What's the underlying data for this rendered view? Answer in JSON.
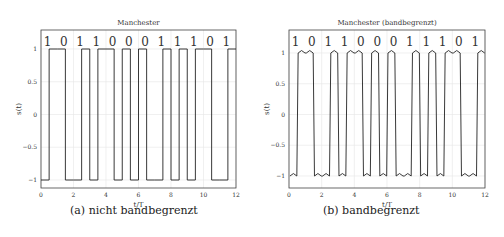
{
  "chart_data": [
    {
      "type": "line",
      "title": "Manchester",
      "xlabel": "t/T",
      "ylabel": "s(t)",
      "xlim": [
        0,
        12
      ],
      "ylim": [
        -1.2,
        1.35
      ],
      "xticks": [
        "0",
        "2",
        "4",
        "6",
        "8",
        "10",
        "12"
      ],
      "yticks": [
        "1",
        "0.5",
        "0",
        "-0.5",
        "-1"
      ],
      "grid": true,
      "bits": [
        "1",
        "0",
        "1",
        "1",
        "0",
        "0",
        "0",
        "1",
        "1",
        "1",
        "0",
        "1"
      ],
      "caption": "(a) nicht bandbegrenzt"
    },
    {
      "type": "line",
      "title": "Manchester (bandbegrenzt)",
      "xlabel": "t/T",
      "ylabel": "s(t)",
      "xlim": [
        0,
        12
      ],
      "ylim": [
        -1.2,
        1.35
      ],
      "xticks": [
        "0",
        "2",
        "4",
        "6",
        "8",
        "10",
        "12"
      ],
      "yticks": [
        "1",
        "0.5",
        "0",
        "-0.5",
        "-1"
      ],
      "grid": true,
      "bits": [
        "1",
        "0",
        "1",
        "1",
        "0",
        "0",
        "0",
        "1",
        "1",
        "1",
        "0",
        "1"
      ],
      "caption": "(b) bandbegrenzt"
    }
  ]
}
